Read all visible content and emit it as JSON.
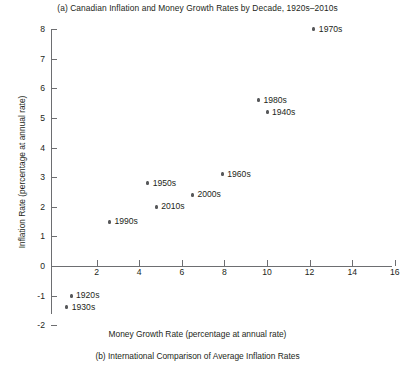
{
  "figure": {
    "title_a": "(a) Canadian Inflation and Money Growth Rates by Decade, 1920s–2010s",
    "caption_b": "(b) International Comparison of Average Inflation Rates"
  },
  "chart_data": {
    "type": "scatter",
    "title": "(a) Canadian Inflation and Money Growth Rates by Decade, 1920s–2010s",
    "xlabel": "Money Growth Rate (percentage at annual rate)",
    "ylabel": "Inflation Rate (percentage at annual rate)",
    "xlim": [
      0,
      16
    ],
    "ylim": [
      -2,
      8
    ],
    "grid": false,
    "legend": "none",
    "xticks": [
      2,
      4,
      6,
      8,
      10,
      12,
      14,
      16
    ],
    "xtick_labels": [
      "2",
      "4",
      "6",
      "8",
      "10",
      "12",
      "14",
      "16"
    ],
    "yticks": [
      -2,
      -1,
      0,
      1,
      2,
      3,
      4,
      5,
      6,
      7,
      8
    ],
    "ytick_labels": [
      "-2",
      "-1",
      "0",
      "1",
      "2",
      "3",
      "4",
      "5",
      "6",
      "7",
      "8"
    ],
    "points": [
      {
        "label": "1970s",
        "x": 12.2,
        "y": 8.0,
        "label_side": "right"
      },
      {
        "label": "1980s",
        "x": 9.6,
        "y": 5.6,
        "label_side": "right"
      },
      {
        "label": "1940s",
        "x": 10.0,
        "y": 5.2,
        "label_side": "right"
      },
      {
        "label": "1960s",
        "x": 7.9,
        "y": 3.1,
        "label_side": "right"
      },
      {
        "label": "1950s",
        "x": 4.4,
        "y": 2.8,
        "label_side": "right"
      },
      {
        "label": "2000s",
        "x": 6.5,
        "y": 2.4,
        "label_side": "right"
      },
      {
        "label": "2010s",
        "x": 4.8,
        "y": 2.0,
        "label_side": "right"
      },
      {
        "label": "1990s",
        "x": 2.6,
        "y": 1.5,
        "label_side": "right"
      },
      {
        "label": "1920s",
        "x": 0.8,
        "y": -1.0,
        "label_side": "right"
      },
      {
        "label": "1930s",
        "x": 0.6,
        "y": -1.4,
        "label_side": "right"
      }
    ]
  },
  "style": {
    "axis_color": "#6d6e71",
    "marker_color": "#58595b",
    "text_color": "#231f20",
    "background": "#ffffff"
  }
}
